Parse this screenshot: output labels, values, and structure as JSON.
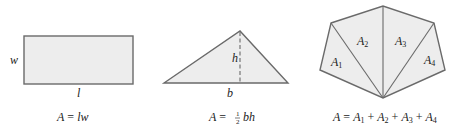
{
  "figures": {
    "rectangle": {
      "side_label_width": "w",
      "side_label_length": "l",
      "formula": {
        "lhs": "A",
        "eq": " = ",
        "rhs": "lw"
      }
    },
    "triangle": {
      "height_label": "h",
      "base_label": "b",
      "formula": {
        "lhs": "A",
        "eq": " = ",
        "frac_num": "1",
        "frac_den": "2",
        "rhs": "bh"
      }
    },
    "polygon": {
      "regions": [
        {
          "label": "A",
          "sub": "1"
        },
        {
          "label": "A",
          "sub": "2"
        },
        {
          "label": "A",
          "sub": "3"
        },
        {
          "label": "A",
          "sub": "4"
        }
      ],
      "formula": {
        "lhs": "A",
        "eq": " = ",
        "terms": [
          {
            "label": "A",
            "sub": "1"
          },
          {
            "label": "A",
            "sub": "2"
          },
          {
            "label": "A",
            "sub": "3"
          },
          {
            "label": "A",
            "sub": "4"
          }
        ],
        "plus": " + "
      }
    }
  },
  "colors": {
    "fill": "#ededed",
    "stroke": "#6a6a6a",
    "text": "#222222"
  }
}
